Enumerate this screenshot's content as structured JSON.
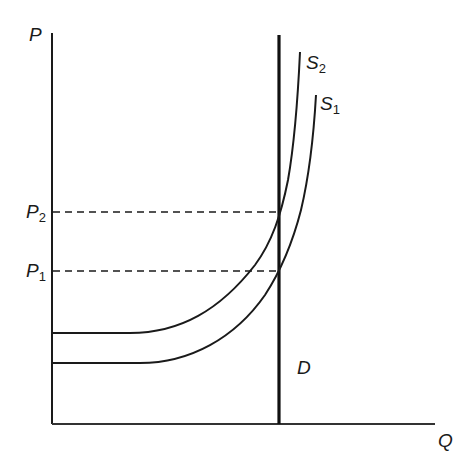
{
  "diagram": {
    "type": "supply-demand",
    "axes": {
      "y_label": "P",
      "x_label": "Q"
    },
    "curves": [
      {
        "id": "S2",
        "label": "S",
        "sub": "2",
        "kind": "supply"
      },
      {
        "id": "S1",
        "label": "S",
        "sub": "1",
        "kind": "supply"
      },
      {
        "id": "D",
        "label": "D",
        "kind": "demand (vertical)"
      }
    ],
    "price_levels": [
      {
        "label": "P",
        "sub": "2"
      },
      {
        "label": "P",
        "sub": "1"
      }
    ],
    "colors": {
      "line": "#1a1a1a",
      "background": "#ffffff"
    }
  }
}
